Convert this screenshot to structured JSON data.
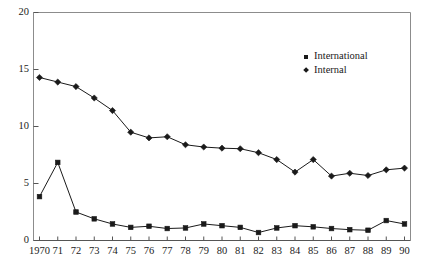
{
  "chart_data": {
    "type": "line",
    "title": "",
    "subtitle": "",
    "xlabel": "",
    "ylabel": "",
    "x": [
      1970,
      1971,
      1972,
      1973,
      1974,
      1975,
      1976,
      1977,
      1978,
      1979,
      1980,
      1981,
      1982,
      1983,
      1984,
      1985,
      1986,
      1987,
      1988,
      1989,
      1990
    ],
    "categories": [
      "1970",
      "71",
      "72",
      "73",
      "74",
      "75",
      "76",
      "77",
      "78",
      "79",
      "80",
      "81",
      "82",
      "83",
      "84",
      "85",
      "86",
      "87",
      "88",
      "89",
      "90"
    ],
    "series": [
      {
        "name": "International",
        "marker": "square",
        "color": "#1a1a1a",
        "values": [
          3.85,
          6.85,
          2.5,
          1.9,
          1.45,
          1.15,
          1.25,
          1.05,
          1.1,
          1.45,
          1.3,
          1.15,
          0.7,
          1.1,
          1.3,
          1.2,
          1.05,
          0.95,
          0.9,
          1.75,
          1.45
        ]
      },
      {
        "name": "Internal",
        "marker": "diamond",
        "color": "#1a1a1a",
        "values": [
          14.3,
          13.9,
          13.5,
          12.5,
          11.4,
          9.5,
          9.0,
          9.1,
          8.4,
          8.2,
          8.1,
          8.05,
          7.7,
          7.1,
          6.0,
          7.1,
          5.65,
          5.9,
          5.7,
          6.2,
          6.35
        ]
      }
    ],
    "ylim": [
      0,
      20
    ],
    "yticks": [
      0,
      5,
      10,
      15,
      20
    ],
    "ytick_labels": [
      "0",
      "5",
      "10",
      "15",
      "20"
    ],
    "grid": false,
    "legend_position": "top-right",
    "legend_entries": [
      "International",
      "Internal"
    ]
  },
  "axes": {
    "x_axis_name": "year-axis",
    "y_axis_name": "value-axis"
  }
}
